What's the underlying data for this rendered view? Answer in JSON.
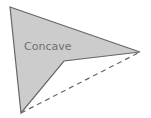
{
  "diagram": {
    "label": "Concave",
    "shape": {
      "type": "concave-polygon",
      "vertices": [
        [
          10,
          7
        ],
        [
          140,
          52
        ],
        [
          64,
          61
        ],
        [
          21,
          113
        ]
      ],
      "fill": "#cccccc",
      "stroke": "#666666"
    },
    "hull_edge": {
      "style": "dashed",
      "from": [
        21,
        113
      ],
      "to": [
        140,
        52
      ],
      "stroke": "#666666"
    }
  }
}
